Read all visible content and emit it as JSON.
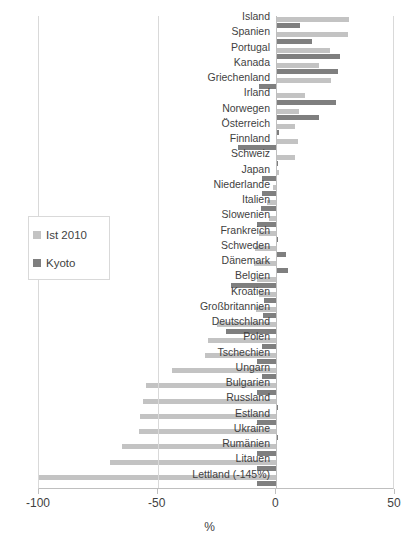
{
  "chart_data": {
    "type": "bar",
    "orientation": "horizontal",
    "title": "",
    "xlabel": "%",
    "ylabel": "",
    "xlim": [
      -100,
      50
    ],
    "xticks": [
      -100,
      -50,
      0,
      50
    ],
    "xticklabels": [
      "-100",
      "-50",
      "0",
      "50"
    ],
    "grid": true,
    "legend_position": "left-middle",
    "categories": [
      "Island",
      "Spanien",
      "Portugal",
      "Kanada",
      "Griechenland",
      "Irland",
      "Norwegen",
      "Österreich",
      "Finnland",
      "Schweiz",
      "Japan",
      "Niederlande",
      "Italien",
      "Slowenien",
      "Frankreich",
      "Schweden",
      "Dänemark",
      "Belgien",
      "Kroatien",
      "Großbritannien",
      "Deutschland",
      "Polen",
      "Tschechien",
      "Ungarn",
      "Bulgarien",
      "Russland",
      "Estland",
      "Ukraine",
      "Rumänien",
      "Litauen",
      "Lettland (-145%)"
    ],
    "series": [
      {
        "name": "Ist 2010",
        "color": "#c3c3c3",
        "values": [
          30.5,
          30.0,
          22.5,
          18.0,
          23.0,
          12.0,
          9.5,
          8.0,
          9.0,
          8.0,
          1.0,
          -1.5,
          -4.0,
          -3.0,
          -7.5,
          -9.0,
          -9.5,
          -8.0,
          -7.5,
          -8.5,
          -25.0,
          -29.0,
          -30.0,
          -44.0,
          -55.0,
          -56.0,
          -57.5,
          -58.0,
          -65.0,
          -70.0,
          -100.0
        ]
      },
      {
        "name": "Kyoto",
        "color": "#7f7f7f",
        "values": [
          10.0,
          15.0,
          27.0,
          26.0,
          -7.5,
          25.0,
          18.0,
          1.0,
          -16.0,
          0.0,
          -6.0,
          -6.0,
          -6.5,
          -8.0,
          0.0,
          4.0,
          5.0,
          -19.0,
          -5.0,
          -5.5,
          -21.0,
          -6.0,
          -8.0,
          -6.0,
          -8.0,
          0.0,
          -8.0,
          0.0,
          -8.0,
          -8.0,
          -8.0
        ]
      }
    ],
    "notes": [
      "Lettland (-145%)"
    ]
  },
  "legend": {
    "items": [
      {
        "label": "Ist 2010",
        "color": "#c3c3c3"
      },
      {
        "label": "Kyoto",
        "color": "#7f7f7f"
      }
    ]
  },
  "axis": {
    "x_title": "%",
    "ticks": [
      {
        "label": "-100",
        "value": -100
      },
      {
        "label": "-50",
        "value": -50
      },
      {
        "label": "0",
        "value": 0
      },
      {
        "label": "50",
        "value": 50
      }
    ]
  },
  "colors": {
    "ist_2010": "#c3c3c3",
    "kyoto": "#7f7f7f",
    "gridline": "#d9d9d9",
    "axis": "#bfbfbf",
    "text": "#3f3f3f",
    "background": "#ffffff"
  }
}
